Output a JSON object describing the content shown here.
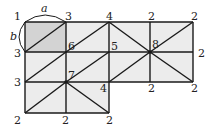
{
  "diagram": {
    "colors": {
      "fill": "#ececec",
      "shaded": "#d3d3d3",
      "line": "#1a1a1a"
    },
    "dimension_labels": {
      "width": "a",
      "height": "b"
    },
    "vertex_labels": [
      {
        "id": "v1",
        "text": "1",
        "x": 14,
        "y": 20
      },
      {
        "id": "v2",
        "text": "3",
        "x": 65,
        "y": 20
      },
      {
        "id": "v3",
        "text": "4",
        "x": 106,
        "y": 20
      },
      {
        "id": "v4",
        "text": "2",
        "x": 148,
        "y": 20
      },
      {
        "id": "v5",
        "text": "2",
        "x": 191,
        "y": 20
      },
      {
        "id": "v6",
        "text": "3",
        "x": 14,
        "y": 57
      },
      {
        "id": "v7",
        "text": "6",
        "x": 68,
        "y": 50
      },
      {
        "id": "v8",
        "text": "5",
        "x": 111,
        "y": 50
      },
      {
        "id": "v9",
        "text": "8",
        "x": 152,
        "y": 48
      },
      {
        "id": "v10",
        "text": "2",
        "x": 198,
        "y": 57
      },
      {
        "id": "v11",
        "text": "3",
        "x": 14,
        "y": 86
      },
      {
        "id": "v12",
        "text": "7",
        "x": 68,
        "y": 79
      },
      {
        "id": "v13",
        "text": "4",
        "x": 100,
        "y": 92
      },
      {
        "id": "v14",
        "text": "2",
        "x": 148,
        "y": 92
      },
      {
        "id": "v15",
        "text": "2",
        "x": 191,
        "y": 92
      },
      {
        "id": "v16",
        "text": "2",
        "x": 14,
        "y": 124
      },
      {
        "id": "v17",
        "text": "2",
        "x": 62,
        "y": 124
      },
      {
        "id": "v18",
        "text": "2",
        "x": 106,
        "y": 124
      }
    ]
  }
}
